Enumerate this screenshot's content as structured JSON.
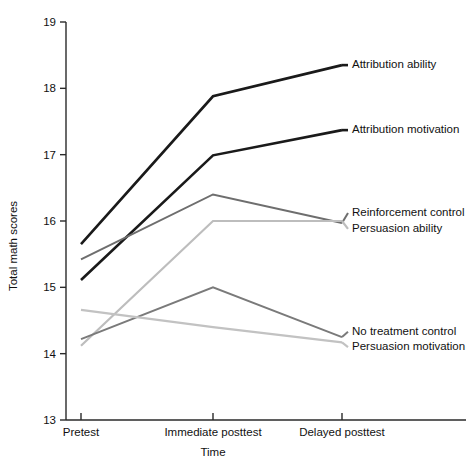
{
  "chart_data": {
    "type": "line",
    "title": "",
    "xlabel": "Time",
    "ylabel": "Total math scores",
    "categories": [
      "Pretest",
      "Immediate posttest",
      "Delayed posttest"
    ],
    "ylim": [
      13,
      19
    ],
    "yticks": [
      13,
      14,
      15,
      16,
      17,
      18,
      19
    ],
    "ytick_labels": [
      "13",
      "14",
      "15",
      "16",
      "17",
      "18",
      "19"
    ],
    "grid": false,
    "legend_position": "right-inline-labels",
    "series": [
      {
        "name": "Attribution ability",
        "values": [
          15.65,
          17.88,
          18.35
        ],
        "color": "#1a1a1a",
        "width": 2.6,
        "label_y": 18.35
      },
      {
        "name": "Attribution motivation",
        "values": [
          15.11,
          16.99,
          17.37
        ],
        "color": "#1a1a1a",
        "width": 2.6,
        "label_y": 17.37
      },
      {
        "name": "Reinforcement control",
        "values": [
          15.42,
          16.4,
          15.97
        ],
        "color": "#6e6e6e",
        "width": 2.0,
        "label_y": 16.12
      },
      {
        "name": "Persuasion ability",
        "values": [
          14.12,
          16.0,
          16.0
        ],
        "color": "#bdbdbd",
        "width": 2.2,
        "label_y": 15.88
      },
      {
        "name": "No treatment control",
        "values": [
          14.22,
          15.0,
          14.25
        ],
        "color": "#7a7a7a",
        "width": 2.0,
        "label_y": 14.33
      },
      {
        "name": "Persuasion motivation",
        "values": [
          14.66,
          14.4,
          14.17
        ],
        "color": "#c2c2c2",
        "width": 2.2,
        "label_y": 14.1
      }
    ]
  },
  "axes": {
    "y_title": "Total math scores",
    "x_title": "Time"
  }
}
